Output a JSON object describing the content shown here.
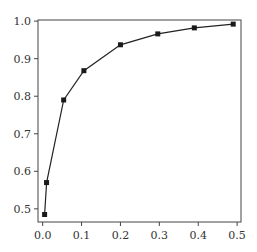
{
  "chart_data": {
    "type": "line",
    "title": "",
    "xlabel": "",
    "ylabel": "",
    "xlim": [
      -0.012,
      0.51
    ],
    "ylim": [
      0.465,
      1.003
    ],
    "xticks": [
      0.0,
      0.1,
      0.2,
      0.3,
      0.4,
      0.5
    ],
    "xtick_labels": [
      "0.0",
      "0.1",
      "0.2",
      "0.3",
      "0.4",
      "0.5"
    ],
    "yticks": [
      0.5,
      0.6,
      0.7,
      0.8,
      0.9,
      1.0
    ],
    "ytick_labels": [
      "0.5",
      "0.6",
      "0.7",
      "0.8",
      "0.9",
      "1.0"
    ],
    "grid": false,
    "legend": null,
    "series": [
      {
        "name": "series-1",
        "color": "#222222",
        "marker": "square",
        "x": [
          0.005,
          0.01,
          0.054,
          0.106,
          0.2,
          0.296,
          0.39,
          0.49
        ],
        "y": [
          0.485,
          0.57,
          0.79,
          0.868,
          0.937,
          0.966,
          0.982,
          0.992
        ]
      }
    ]
  },
  "plot_area": {
    "left": 38,
    "top": 20,
    "right": 241,
    "bottom": 222
  },
  "colors": {
    "axis": "#444444",
    "line": "#222222",
    "marker": "#1a1a1a",
    "text": "#333333"
  }
}
